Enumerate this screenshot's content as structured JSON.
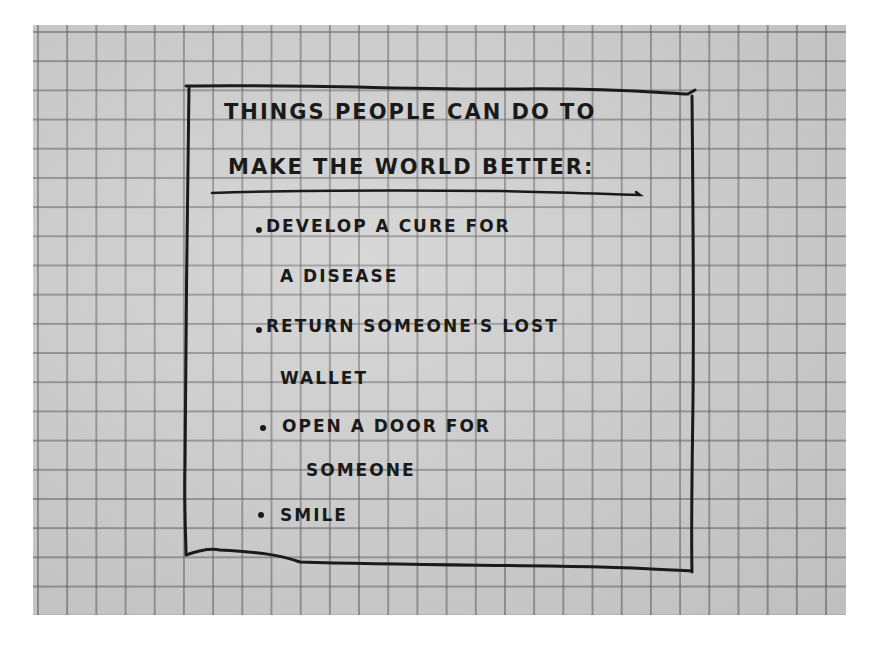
{
  "note": {
    "title_lines": [
      "Things people can do to",
      "make the world better:"
    ],
    "items": [
      {
        "lines": [
          "Develop a cure for",
          "a disease"
        ]
      },
      {
        "lines": [
          "Return someone's lost",
          "wallet"
        ]
      },
      {
        "lines": [
          "Open a door for",
          "someone"
        ]
      },
      {
        "lines": [
          "Smile"
        ]
      }
    ]
  },
  "colors": {
    "paper": "#cfcfcf",
    "grid": "#5a5a5a",
    "ink": "#1a1a1a",
    "background": "#ffffff"
  }
}
